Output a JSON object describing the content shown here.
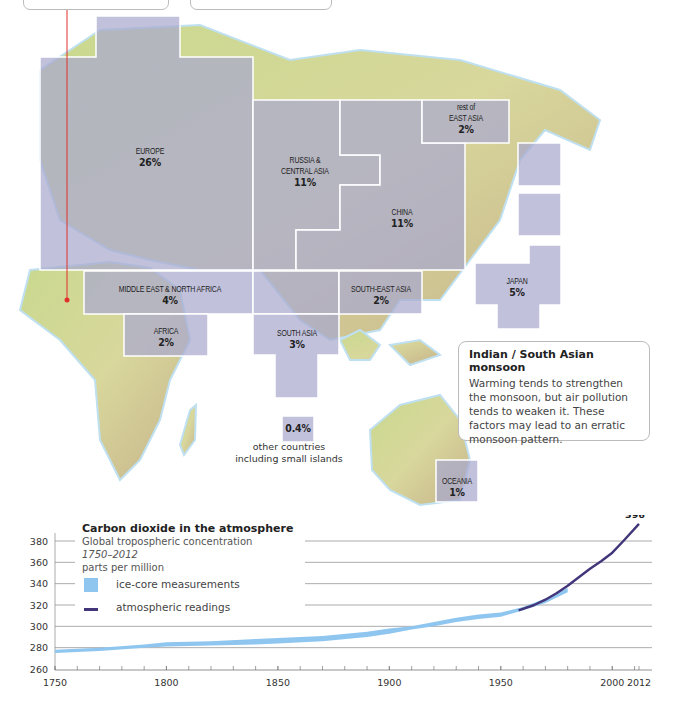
{
  "map": {
    "regions": [
      {
        "id": "europe",
        "name": "EUROPE",
        "share": "26%"
      },
      {
        "id": "russia",
        "name": "RUSSIA & CENTRAL ASIA",
        "name_lines": [
          "RUSSIA &",
          "CENTRAL ASIA"
        ],
        "share": "11%"
      },
      {
        "id": "rest-east-asia",
        "name": "rest of EAST ASIA",
        "name_lines": [
          "rest of",
          "EAST ASIA"
        ],
        "share": "2%"
      },
      {
        "id": "china",
        "name": "CHINA",
        "share": "11%"
      },
      {
        "id": "japan",
        "name": "JAPAN",
        "share": "5%"
      },
      {
        "id": "mena",
        "name": "MIDDLE EAST & NORTH AFRICA",
        "share": "4%"
      },
      {
        "id": "africa",
        "name": "AFRICA",
        "share": "2%"
      },
      {
        "id": "south-asia",
        "name": "SOUTH ASIA",
        "share": "3%"
      },
      {
        "id": "south-east-asia",
        "name": "SOUTH-EAST ASIA",
        "share": "2%"
      },
      {
        "id": "oceania",
        "name": "OCEANIA",
        "share": "1%"
      },
      {
        "id": "other",
        "name": "other countries including small islands",
        "share": "0.4%"
      }
    ],
    "other_label_lines": [
      "other countries",
      "including small islands"
    ],
    "block_color": "#a9a9cf",
    "pointer_color": "#e0302a"
  },
  "monsoon_callout": {
    "title": "Indian / South Asian monsoon",
    "body": "Warming tends to strengthen the monsoon, but air pollution tends to weaken it. These factors may lead to an erratic monsoon pattern."
  },
  "chart_data": {
    "type": "line",
    "title": "Carbon dioxide in the atmosphere",
    "subtitle": "Global tropospheric concentration",
    "period": "1750–2012",
    "ylabel": "parts per million",
    "xlabel": "",
    "xlim": [
      1750,
      2012
    ],
    "ylim": [
      260,
      390
    ],
    "x_ticks": [
      1750,
      1800,
      1850,
      1900,
      1950,
      2000,
      2012
    ],
    "y_ticks": [
      260,
      280,
      300,
      320,
      340,
      360,
      380
    ],
    "grid": true,
    "legend": [
      {
        "name": "ice-core measurements",
        "color": "#8fc6ef"
      },
      {
        "name": "atmospheric readings",
        "color": "#43357a"
      }
    ],
    "series": [
      {
        "name": "ice-core measurements",
        "style": "band",
        "color": "#8fc6ef",
        "x": [
          1750,
          1770,
          1790,
          1800,
          1820,
          1840,
          1850,
          1870,
          1890,
          1900,
          1910,
          1920,
          1930,
          1940,
          1950,
          1960,
          1970,
          1980
        ],
        "low": [
          275,
          277,
          280,
          281,
          282,
          283,
          284,
          286,
          290,
          293,
          297,
          300,
          304,
          307,
          309,
          315,
          322,
          332
        ],
        "high": [
          278,
          280,
          283,
          285,
          286,
          288,
          289,
          291,
          295,
          298,
          300,
          304,
          308,
          311,
          313,
          318,
          326,
          336
        ]
      },
      {
        "name": "atmospheric readings",
        "style": "line",
        "color": "#43357a",
        "x": [
          1958,
          1965,
          1970,
          1975,
          1980,
          1985,
          1990,
          1995,
          2000,
          2005,
          2012
        ],
        "y": [
          315,
          320,
          325,
          331,
          338,
          346,
          354,
          361,
          369,
          380,
          396
        ]
      }
    ],
    "annotations": [
      {
        "x": 2012,
        "y": 396,
        "text": "396"
      }
    ]
  }
}
